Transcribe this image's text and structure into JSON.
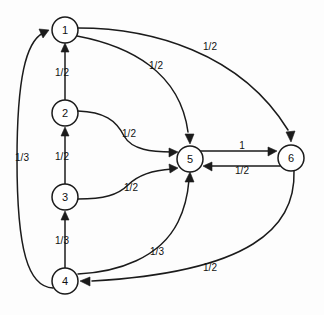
{
  "diagram": {
    "type": "directed-graph",
    "background_color": "#fdfdfd",
    "stroke_color": "#1b1b1b",
    "node_fill": "#ffffff",
    "node_radius": 13,
    "nodes": [
      {
        "id": "1",
        "label": "1",
        "x": 65,
        "y": 30
      },
      {
        "id": "2",
        "label": "2",
        "x": 65,
        "y": 113
      },
      {
        "id": "3",
        "label": "3",
        "x": 65,
        "y": 197
      },
      {
        "id": "4",
        "label": "4",
        "x": 65,
        "y": 281
      },
      {
        "id": "5",
        "label": "5",
        "x": 190,
        "y": 159
      },
      {
        "id": "6",
        "label": "6",
        "x": 291,
        "y": 158
      }
    ],
    "edges": [
      {
        "id": "e2-1",
        "from": "2",
        "to": "1",
        "label": "1/2",
        "label_x": 62,
        "label_y": 72
      },
      {
        "id": "e3-2",
        "from": "3",
        "to": "2",
        "label": "1/2",
        "label_x": 62,
        "label_y": 156
      },
      {
        "id": "e4-3",
        "from": "4",
        "to": "3",
        "label": "1/3",
        "label_x": 62,
        "label_y": 240
      },
      {
        "id": "e4-1",
        "from": "4",
        "to": "1",
        "label": "1/3",
        "label_x": 22,
        "label_y": 157
      },
      {
        "id": "e1-6",
        "from": "1",
        "to": "6",
        "label": "1/2",
        "label_x": 210,
        "label_y": 46
      },
      {
        "id": "e1-5",
        "from": "1",
        "to": "5",
        "label": "1/2",
        "label_x": 156,
        "label_y": 65
      },
      {
        "id": "e2-5",
        "from": "2",
        "to": "5",
        "label": "1/2",
        "label_x": 129,
        "label_y": 133
      },
      {
        "id": "e3-5",
        "from": "3",
        "to": "5",
        "label": "1/2",
        "label_x": 131,
        "label_y": 187
      },
      {
        "id": "e4-5",
        "from": "4",
        "to": "5",
        "label": "1/3",
        "label_x": 157,
        "label_y": 251
      },
      {
        "id": "e5-6",
        "from": "5",
        "to": "6",
        "label": "1",
        "label_x": 242,
        "label_y": 148
      },
      {
        "id": "e6-5",
        "from": "6",
        "to": "5",
        "label": "1/2",
        "label_x": 240,
        "label_y": 169
      },
      {
        "id": "e6-4",
        "from": "6",
        "to": "4",
        "label": "1/2",
        "label_x": 210,
        "label_y": 267
      }
    ]
  }
}
